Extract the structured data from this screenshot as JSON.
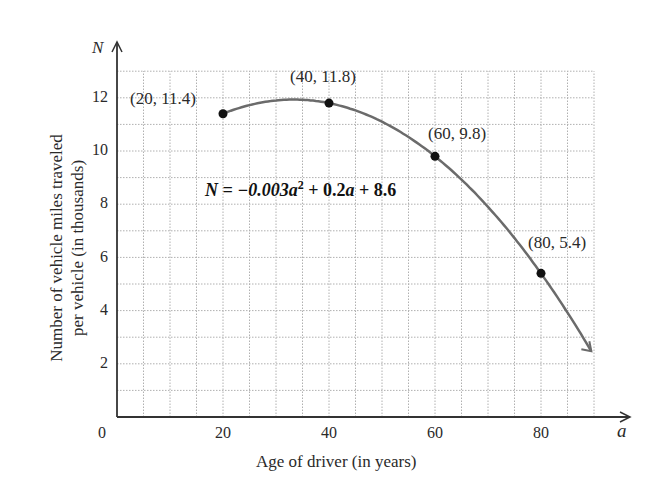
{
  "chart_data": {
    "type": "line",
    "title": "",
    "xlabel": "Age of driver (in years)",
    "ylabel": "Number of vehicle miles traveled per vehicle (in thousands)",
    "x_axis_symbol": "a",
    "y_axis_symbol": "N",
    "xlim": [
      0,
      90
    ],
    "ylim": [
      0,
      13
    ],
    "x_ticks": [
      0,
      20,
      40,
      60,
      80
    ],
    "y_ticks": [
      2,
      4,
      6,
      8,
      10,
      12
    ],
    "grid": true,
    "grid_step_x": 5,
    "grid_step_y": 1,
    "equation": "N = −0.003a² + 0.2a + 8.6",
    "series": [
      {
        "name": "N = -0.003a^2 + 0.2a + 8.6",
        "x": [
          20,
          25,
          30,
          35,
          40,
          45,
          50,
          55,
          60,
          65,
          70,
          75,
          80,
          85,
          90
        ],
        "values": [
          11.4,
          11.725,
          11.9,
          11.925,
          11.8,
          11.525,
          11.1,
          10.525,
          9.8,
          8.925,
          7.9,
          6.725,
          5.4,
          3.925,
          2.3
        ]
      }
    ],
    "points": [
      {
        "x": 20,
        "y": 11.4,
        "label": "(20, 11.4)"
      },
      {
        "x": 40,
        "y": 11.8,
        "label": "(40, 11.8)"
      },
      {
        "x": 60,
        "y": 9.8,
        "label": "(60, 9.8)"
      },
      {
        "x": 80,
        "y": 5.4,
        "label": "(80, 5.4)"
      }
    ]
  },
  "labels": {
    "y_symbol": "N",
    "x_symbol": "a",
    "origin": "0",
    "xlabel": "Age of driver (in years)",
    "ylabel_line1": "Number of vehicle miles traveled",
    "ylabel_line2": "per vehicle (in thousands)",
    "eq_lhs": "N = −0.003",
    "eq_var1": "a",
    "eq_exp": "2",
    "eq_mid": " + 0.2",
    "eq_var2": "a",
    "eq_rhs": " + 8.6",
    "x_ticks": [
      "20",
      "40",
      "60",
      "80"
    ],
    "y_ticks": [
      "12",
      "10",
      "8",
      "6",
      "4",
      "2"
    ],
    "points": [
      "(20, 11.4)",
      "(40, 11.8)",
      "(60, 9.8)",
      "(80, 5.4)"
    ]
  },
  "colors": {
    "curve": "#6b6b6b",
    "axis": "#333333",
    "grid": "#b0b0b0",
    "point": "#111111"
  }
}
